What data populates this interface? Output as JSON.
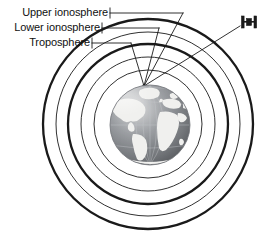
{
  "figure": {
    "background_color": "#ffffff",
    "line_color": "#1a1a1a",
    "width": 269,
    "height": 233
  },
  "labels": [
    {
      "id": "upper-ionosphere",
      "text": "Upper ionosphere",
      "bracket_x": 110,
      "bracket_y": 13,
      "leader_to_x": 182,
      "leader_to_y": 13
    },
    {
      "id": "lower-ionosphere",
      "text": "Lower ionosphere",
      "bracket_x": 102,
      "bracket_y": 28,
      "leader_to_x": 158,
      "leader_to_y": 28
    },
    {
      "id": "troposphere",
      "text": "Troposphere",
      "bracket_x": 92,
      "bracket_y": 43,
      "leader_to_x": 130,
      "leader_to_y": 43
    }
  ],
  "rings": [
    {
      "id": "outer-ring-upper-ionosphere-outer",
      "cx": 148,
      "cy": 124,
      "r": 105,
      "stroke_width": 2.2
    },
    {
      "id": "ring-upper-ionosphere-inner",
      "cx": 148,
      "cy": 124,
      "r": 92,
      "stroke_width": 1.0
    },
    {
      "id": "ring-lower-ionosphere-outer",
      "cx": 148,
      "cy": 124,
      "r": 80,
      "stroke_width": 2.2
    },
    {
      "id": "ring-lower-ionosphere-inner",
      "cx": 148,
      "cy": 124,
      "r": 67,
      "stroke_width": 1.0
    },
    {
      "id": "ring-troposphere",
      "cx": 148,
      "cy": 124,
      "r": 54,
      "stroke_width": 1.0
    }
  ],
  "globe": {
    "id": "earth-globe",
    "cx": 150,
    "cy": 125,
    "r": 40,
    "description": "Earth globe centered on the Atlantic Ocean showing the Americas, Europe and Africa",
    "ocean_color": "#8f9296",
    "land_color": "#f2f2f0",
    "graticule_color": "#b9bcc0"
  },
  "satellite": {
    "id": "satellite",
    "x": 249,
    "y": 23,
    "body_label": "satellite body with two solar panels",
    "tether_from_x": 240,
    "tether_from_y": 26,
    "tether_to_x": 144,
    "tether_to_y": 86
  },
  "convergence_point": {
    "x": 144,
    "y": 86
  }
}
